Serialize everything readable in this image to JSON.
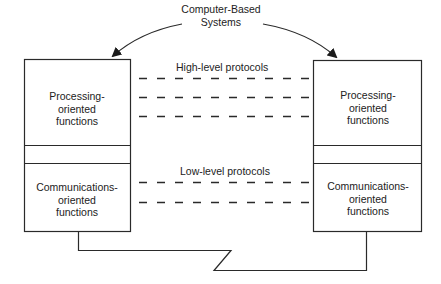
{
  "title": {
    "line1": "Computer-Based",
    "line2": "Systems"
  },
  "protocols": {
    "high": "High-level protocols",
    "low": "Low-level protocols"
  },
  "systems": [
    {
      "side": "left",
      "upper": {
        "line1": "Processing-",
        "line2": "oriented",
        "line3": "functions"
      },
      "lower": {
        "line1": "Communications-",
        "line2": "oriented",
        "line3": "functions"
      }
    },
    {
      "side": "right",
      "upper": {
        "line1": "Processing-",
        "line2": "oriented",
        "line3": "functions"
      },
      "lower": {
        "line1": "Communications-",
        "line2": "oriented",
        "line3": "functions"
      }
    }
  ],
  "colors": {
    "line": "#2a2a2a",
    "background": "#ffffff"
  }
}
